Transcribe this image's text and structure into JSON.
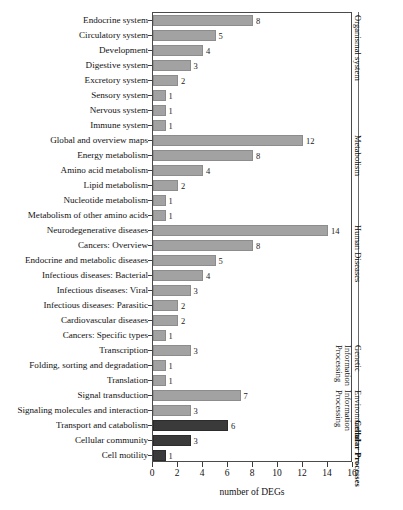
{
  "chart_data": {
    "type": "bar",
    "orientation": "horizontal",
    "title": "",
    "xlabel": "number of DEGs",
    "ylabel": "",
    "xlim": [
      0,
      16
    ],
    "xticks": [
      0,
      2,
      4,
      6,
      8,
      10,
      12,
      14,
      16
    ],
    "grid": false,
    "legend": "none",
    "categories": [
      "Endocrine system",
      "Circulatory system",
      "Development",
      "Digestive system",
      "Excretory system",
      "Sensory system",
      "Nervous system",
      "Immune system",
      "Global and overview maps",
      "Energy metabolism",
      "Amino acid metabolism",
      "Lipid metabolism",
      "Nucleotide metabolism",
      "Metabolism of other amino acids",
      "Neurodegenerative diseases",
      "Cancers: Overview",
      "Endocrine and metabolic diseases",
      "Infectious diseases: Bacterial",
      "Infectious diseases: Viral",
      "Infectious diseases: Parasitic",
      "Cardiovascular diseases",
      "Cancers: Specific types",
      "Transcription",
      "Folding, sorting and degradation",
      "Translation",
      "Signal transduction",
      "Signaling molecules and interaction",
      "Transport and catabolism",
      "Cellular community",
      "Cell motility"
    ],
    "values": [
      8,
      5,
      4,
      3,
      2,
      1,
      1,
      1,
      12,
      8,
      4,
      2,
      1,
      1,
      14,
      8,
      5,
      4,
      3,
      2,
      2,
      1,
      3,
      1,
      1,
      7,
      3,
      6,
      3,
      1
    ],
    "value_labels": [
      "8",
      "5",
      "4",
      "3",
      "2",
      "1",
      "1",
      "1",
      "12",
      "8",
      "4",
      "2",
      "1",
      "1",
      "14",
      "8",
      "5",
      "4",
      "3",
      "2",
      "2",
      "1",
      "3",
      "1",
      "1",
      "7",
      "3",
      "6",
      "3",
      "1"
    ],
    "bar_colors": [
      "#a2a2a2",
      "#a2a2a2",
      "#a2a2a2",
      "#a2a2a2",
      "#a2a2a2",
      "#a2a2a2",
      "#a2a2a2",
      "#a2a2a2",
      "#a2a2a2",
      "#a2a2a2",
      "#a2a2a2",
      "#a2a2a2",
      "#a2a2a2",
      "#a2a2a2",
      "#a2a2a2",
      "#a2a2a2",
      "#a2a2a2",
      "#a2a2a2",
      "#a2a2a2",
      "#a2a2a2",
      "#a2a2a2",
      "#a2a2a2",
      "#a2a2a2",
      "#a2a2a2",
      "#a2a2a2",
      "#a2a2a2",
      "#a2a2a2",
      "#3a3a3a",
      "#3a3a3a",
      "#3a3a3a"
    ],
    "groups": [
      {
        "label": "Organismal system",
        "start": 0,
        "end": 7,
        "bold": false,
        "two_line": false
      },
      {
        "label": "Metabolism",
        "start": 8,
        "end": 13,
        "bold": false,
        "two_line": false
      },
      {
        "label": "Human Diseases",
        "start": 14,
        "end": 21,
        "bold": false,
        "two_line": false
      },
      {
        "label": "Genetic Information Processing",
        "start": 22,
        "end": 24,
        "bold": false,
        "two_line": true
      },
      {
        "label": "Environmental Information Processing",
        "start": 25,
        "end": 26,
        "bold": false,
        "two_line": true
      },
      {
        "label": "Cellular Processes",
        "start": 27,
        "end": 29,
        "bold": true,
        "two_line": false
      }
    ],
    "accent_color": "#a2a2a2",
    "accent_color_dark": "#3a3a3a",
    "axis_color": "#4a4a4a"
  }
}
